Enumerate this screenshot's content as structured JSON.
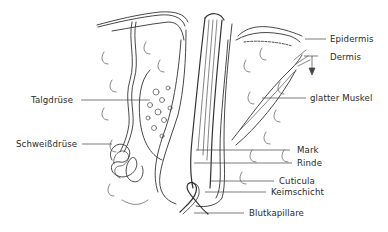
{
  "diagram": {
    "labels": {
      "epidermis": "Epidermis",
      "dermis": "Dermis",
      "talgdruese": "Talgdrüse",
      "glatter_muskel": "glatter Muskel",
      "schweissdruese": "Schweißdrüse",
      "mark": "Mark",
      "rinde": "Rinde",
      "cuticula": "Cuticula",
      "keimschicht": "Keimschicht",
      "blutkapillare": "Blutkapillare"
    },
    "colors": {
      "ink": "#2a2a2a",
      "background": "#ffffff"
    }
  }
}
